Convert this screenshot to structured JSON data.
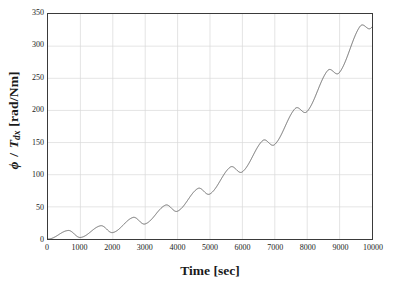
{
  "chart_data": {
    "type": "line",
    "title": "",
    "subtitle": "",
    "xlabel": "Time [sec]",
    "ylabel_parts": {
      "symbol": "ϕ",
      "separator": " / ",
      "variable": "T",
      "subscript": "dx",
      "units": " [rad/Nm]"
    },
    "ylabel": "ϕ / T_dx [rad/Nm]",
    "xlim": [
      0,
      10000
    ],
    "ylim": [
      0,
      350
    ],
    "xticks": [
      0,
      1000,
      2000,
      3000,
      4000,
      5000,
      6000,
      7000,
      8000,
      9000,
      10000
    ],
    "xticklabels": [
      "0",
      "1000",
      "2000",
      "3000",
      "4000",
      "5000",
      "6000",
      "7000",
      "8000",
      "9000",
      "10000"
    ],
    "yticks": [
      0,
      50,
      100,
      150,
      200,
      250,
      300,
      350
    ],
    "yticklabels": [
      "0",
      "50",
      "100",
      "150",
      "200",
      "250",
      "300",
      "350"
    ],
    "grid": true,
    "grid_color": "#d8d8d8",
    "legend": null,
    "line_color": "#5a5a5a",
    "line_width": 0.9,
    "series": [
      {
        "name": "phi / Tdx",
        "oscillation_period": 1000,
        "cycle_peaks": [
          20,
          21,
          29,
          36,
          44,
          52,
          66,
          80,
          99,
          120,
          142,
          165,
          189,
          213,
          240,
          268,
          297,
          313,
          348
        ],
        "cycle_minima": [
          0,
          2,
          3,
          8,
          15,
          21,
          27,
          36,
          47,
          58,
          71,
          86,
          107,
          130,
          154,
          182,
          211,
          241,
          274,
          307
        ],
        "x": [
          0,
          100,
          200,
          300,
          400,
          500,
          600,
          700,
          800,
          900,
          1000,
          1100,
          1200,
          1300,
          1400,
          1500,
          1600,
          1700,
          1800,
          1900,
          2000,
          2100,
          2200,
          2300,
          2400,
          2500,
          2600,
          2700,
          2800,
          2900,
          3000,
          3100,
          3200,
          3300,
          3400,
          3500,
          3600,
          3700,
          3800,
          3900,
          4000,
          4100,
          4200,
          4300,
          4400,
          4500,
          4600,
          4700,
          4800,
          4900,
          5000,
          5100,
          5200,
          5300,
          5400,
          5500,
          5600,
          5700,
          5800,
          5900,
          6000,
          6100,
          6200,
          6300,
          6400,
          6500,
          6600,
          6700,
          6800,
          6900,
          7000,
          7100,
          7200,
          7300,
          7400,
          7500,
          7600,
          7700,
          7800,
          7900,
          8000,
          8100,
          8200,
          8300,
          8400,
          8500,
          8600,
          8700,
          8800,
          8900,
          9000,
          9100,
          9200,
          9300,
          9400,
          9500,
          9600,
          9700,
          9800,
          9900,
          10000
        ],
        "y": [
          0,
          7,
          16,
          20,
          18,
          11,
          4,
          2,
          4,
          10,
          16,
          20,
          21,
          18,
          12,
          6,
          4,
          6,
          12,
          20,
          26,
          29,
          28,
          23,
          17,
          14,
          16,
          21,
          28,
          33,
          36,
          35,
          31,
          25,
          21,
          22,
          27,
          34,
          40,
          44,
          44,
          40,
          34,
          29,
          28,
          31,
          38,
          45,
          51,
          52,
          49,
          43,
          38,
          36,
          39,
          46,
          55,
          62,
          66,
          64,
          58,
          52,
          48,
          50,
          57,
          66,
          75,
          80,
          79,
          73,
          67,
          63,
          66,
          74,
          84,
          94,
          99,
          97,
          92,
          87,
          86,
          90,
          99,
          110,
          118,
          120,
          116,
          111,
          107,
          110,
          118,
          130,
          140,
          142,
          138,
          133,
          130,
          133,
          142,
          155,
          166
        ]
      }
    ]
  },
  "figure": {
    "background": "#ffffff",
    "axis_color": "#3a3a3a"
  }
}
